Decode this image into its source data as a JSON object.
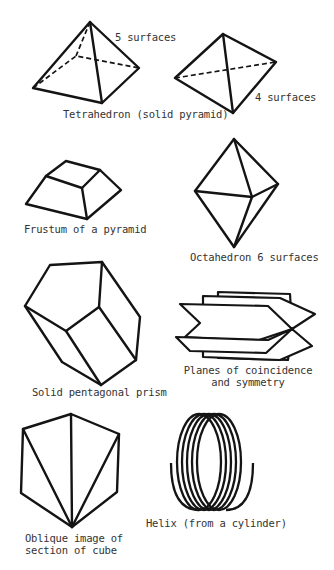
{
  "figures": {
    "pyramid": {
      "surfaces_label": "5 surfaces"
    },
    "tetrahedron": {
      "surfaces_label": "4 surfaces",
      "caption": "Tetrahedron (solid pyramid)"
    },
    "frustum": {
      "caption": "Frustum of a pyramid"
    },
    "octahedron": {
      "caption": "Octahedron 6 surfaces"
    },
    "pentagonal_prism": {
      "caption": "Solid pentagonal prism"
    },
    "planes": {
      "caption_line1": "Planes of coincidence",
      "caption_line2": "and symmetry"
    },
    "cube_section": {
      "caption_line1": "Oblique image of",
      "caption_line2": "section of cube"
    },
    "helix": {
      "caption": "Helix (from a cylinder)"
    }
  },
  "colors": {
    "ink": "#141414",
    "background": "#ffffff"
  }
}
